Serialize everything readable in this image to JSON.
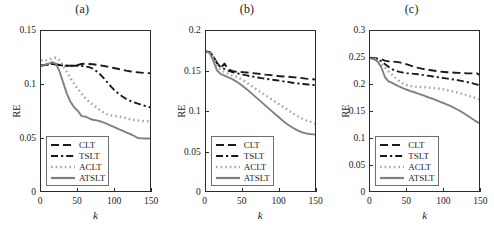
{
  "figure": {
    "width": 494,
    "height": 231,
    "background": "#ffffff",
    "series_styles": {
      "CLT": {
        "color": "#1a1a1a",
        "dash": "8,4",
        "width": 1.9
      },
      "TSLT": {
        "color": "#1a1a1a",
        "dash": "7,3,2.2,3",
        "width": 1.9
      },
      "ACLT": {
        "color": "#a6a6a6",
        "dash": "1.6,3.0",
        "width": 2.4
      },
      "ATSLT": {
        "color": "#808080",
        "dash": "none",
        "width": 1.9
      }
    },
    "legend_labels": [
      "CLT",
      "TSLT",
      "ACLT",
      "ATSLT"
    ]
  },
  "chart_data": [
    {
      "type": "line",
      "title": "(a)",
      "xlabel": "k",
      "ylabel": "RE",
      "xlim": [
        0,
        150
      ],
      "ylim": [
        0,
        0.15
      ],
      "xticks": [
        0,
        50,
        100,
        150
      ],
      "xtick_labels": [
        "0",
        "50",
        "100",
        "150"
      ],
      "yticks": [
        0,
        0.05,
        0.1,
        0.15
      ],
      "ytick_labels": [
        "0",
        "0.05",
        "0.1",
        "0.15"
      ],
      "grid": false,
      "legend_position": "lower left",
      "x": [
        0,
        5,
        10,
        15,
        20,
        25,
        30,
        35,
        40,
        45,
        50,
        55,
        60,
        65,
        70,
        75,
        80,
        85,
        90,
        95,
        100,
        105,
        110,
        115,
        120,
        125,
        130,
        135,
        140,
        145,
        150
      ],
      "series": [
        {
          "name": "CLT",
          "values": [
            0.118,
            0.1185,
            0.119,
            0.1195,
            0.119,
            0.1185,
            0.118,
            0.1178,
            0.1178,
            0.1178,
            0.1185,
            0.1195,
            0.1198,
            0.1195,
            0.1192,
            0.1188,
            0.1182,
            0.1176,
            0.117,
            0.1162,
            0.1155,
            0.1148,
            0.114,
            0.1133,
            0.1127,
            0.1122,
            0.1118,
            0.1115,
            0.1112,
            0.111,
            0.1108
          ]
        },
        {
          "name": "TSLT",
          "values": [
            0.118,
            0.1185,
            0.119,
            0.1195,
            0.119,
            0.1185,
            0.118,
            0.1178,
            0.1178,
            0.1178,
            0.1178,
            0.1176,
            0.1172,
            0.1165,
            0.1152,
            0.1128,
            0.1098,
            0.1062,
            0.1022,
            0.0982,
            0.0948,
            0.0918,
            0.0893,
            0.0872,
            0.0855,
            0.0841,
            0.0829,
            0.0818,
            0.0808,
            0.0798,
            0.0788
          ]
        },
        {
          "name": "ACLT",
          "values": [
            0.1228,
            0.1224,
            0.1232,
            0.1248,
            0.1252,
            0.1228,
            0.1178,
            0.1118,
            0.1062,
            0.1008,
            0.0962,
            0.0918,
            0.0878,
            0.0845,
            0.0818,
            0.0792,
            0.0765,
            0.0742,
            0.0728,
            0.0718,
            0.0712,
            0.0708,
            0.0702,
            0.0694,
            0.0684,
            0.0678,
            0.0672,
            0.0668,
            0.0664,
            0.0662,
            0.0632
          ]
        },
        {
          "name": "ATSLT",
          "values": [
            0.1182,
            0.1186,
            0.1196,
            0.1212,
            0.1198,
            0.1128,
            0.1022,
            0.0918,
            0.0842,
            0.0792,
            0.0758,
            0.0712,
            0.0708,
            0.0692,
            0.0678,
            0.0672,
            0.0664,
            0.0652,
            0.0638,
            0.0622,
            0.0608,
            0.0592,
            0.0578,
            0.0562,
            0.0548,
            0.0532,
            0.0512,
            0.0506,
            0.0504,
            0.0504,
            0.0506
          ]
        }
      ]
    },
    {
      "type": "line",
      "title": "(b)",
      "xlabel": "k",
      "ylabel": "RE",
      "xlim": [
        0,
        150
      ],
      "ylim": [
        0,
        0.2
      ],
      "xticks": [
        0,
        50,
        100,
        150
      ],
      "xtick_labels": [
        "0",
        "50",
        "100",
        "150"
      ],
      "yticks": [
        0,
        0.05,
        0.1,
        0.15,
        0.2
      ],
      "ytick_labels": [
        "0",
        "0.05",
        "0.1",
        "0.15",
        "0.2"
      ],
      "grid": false,
      "legend_position": "lower left",
      "x": [
        0,
        5,
        10,
        15,
        20,
        25,
        30,
        35,
        40,
        45,
        50,
        55,
        60,
        65,
        70,
        75,
        80,
        85,
        90,
        95,
        100,
        105,
        110,
        115,
        120,
        125,
        130,
        135,
        140,
        145,
        150
      ],
      "series": [
        {
          "name": "CLT",
          "values": [
            0.1742,
            0.1738,
            0.1688,
            0.1602,
            0.1548,
            0.1598,
            0.1528,
            0.1508,
            0.1498,
            0.1494,
            0.1492,
            0.1488,
            0.1484,
            0.1478,
            0.1474,
            0.1468,
            0.1462,
            0.1458,
            0.1452,
            0.1446,
            0.1442,
            0.1438,
            0.1436,
            0.1432,
            0.1428,
            0.1424,
            0.1418,
            0.1412,
            0.1408,
            0.1404,
            0.1398
          ]
        },
        {
          "name": "TSLT",
          "values": [
            0.1742,
            0.1738,
            0.1688,
            0.1602,
            0.1548,
            0.1532,
            0.1512,
            0.1494,
            0.1482,
            0.1472,
            0.1462,
            0.1452,
            0.1442,
            0.1434,
            0.1426,
            0.1418,
            0.1412,
            0.1404,
            0.1398,
            0.1392,
            0.1386,
            0.1378,
            0.1372,
            0.1364,
            0.1358,
            0.1352,
            0.1346,
            0.1342,
            0.1338,
            0.1334,
            0.1328
          ]
        },
        {
          "name": "ACLT",
          "values": [
            0.1758,
            0.1742,
            0.1672,
            0.1578,
            0.1512,
            0.1492,
            0.1472,
            0.1452,
            0.1438,
            0.1418,
            0.1392,
            0.1362,
            0.1332,
            0.1302,
            0.1268,
            0.1238,
            0.1208,
            0.1178,
            0.1148,
            0.1118,
            0.1088,
            0.1058,
            0.1028,
            0.0998,
            0.0968,
            0.0942,
            0.0918,
            0.0898,
            0.0882,
            0.0868,
            0.0848
          ]
        },
        {
          "name": "ATSLT",
          "values": [
            0.1752,
            0.1728,
            0.1628,
            0.1512,
            0.1468,
            0.1448,
            0.1428,
            0.1408,
            0.1382,
            0.1352,
            0.1318,
            0.1282,
            0.1242,
            0.1202,
            0.1162,
            0.1122,
            0.1082,
            0.1042,
            0.1002,
            0.0962,
            0.0922,
            0.0882,
            0.0848,
            0.0818,
            0.0792,
            0.0768,
            0.0748,
            0.0736,
            0.0728,
            0.0724,
            0.0722
          ]
        }
      ]
    },
    {
      "type": "line",
      "title": "(c)",
      "xlabel": "k",
      "ylabel": "RE",
      "xlim": [
        0,
        150
      ],
      "ylim": [
        0,
        0.3
      ],
      "xticks": [
        0,
        50,
        100,
        150
      ],
      "xtick_labels": [
        "0",
        "50",
        "100",
        "150"
      ],
      "yticks": [
        0,
        0.05,
        0.1,
        0.15,
        0.2,
        0.25,
        0.3
      ],
      "ytick_labels": [
        "0",
        "0.05",
        "0.1",
        "0.15",
        "0.2",
        "0.25",
        "0.3"
      ],
      "grid": false,
      "legend_position": "lower left",
      "x": [
        0,
        5,
        10,
        15,
        20,
        25,
        30,
        35,
        40,
        45,
        50,
        55,
        60,
        65,
        70,
        75,
        80,
        85,
        90,
        95,
        100,
        105,
        110,
        115,
        120,
        125,
        130,
        135,
        140,
        145,
        150
      ],
      "series": [
        {
          "name": "CLT",
          "values": [
            0.2498,
            0.2496,
            0.2492,
            0.2478,
            0.2452,
            0.2438,
            0.2432,
            0.2428,
            0.2418,
            0.2402,
            0.2382,
            0.2358,
            0.2338,
            0.2318,
            0.2302,
            0.2288,
            0.2278,
            0.2268,
            0.2258,
            0.2248,
            0.2242,
            0.2236,
            0.2232,
            0.2228,
            0.2224,
            0.2222,
            0.2218,
            0.2216,
            0.2214,
            0.2212,
            0.2172
          ]
        },
        {
          "name": "TSLT",
          "values": [
            0.2498,
            0.2492,
            0.2478,
            0.2442,
            0.2388,
            0.2338,
            0.2292,
            0.2262,
            0.2242,
            0.2228,
            0.2218,
            0.2212,
            0.2206,
            0.2198,
            0.2188,
            0.2178,
            0.2168,
            0.2158,
            0.2148,
            0.2138,
            0.2128,
            0.2118,
            0.2108,
            0.2098,
            0.2086,
            0.2072,
            0.2058,
            0.2042,
            0.2026,
            0.2008,
            0.1988
          ]
        },
        {
          "name": "ACLT",
          "values": [
            0.2502,
            0.2492,
            0.2462,
            0.2398,
            0.2322,
            0.2252,
            0.2188,
            0.2128,
            0.2068,
            0.2022,
            0.1998,
            0.1982,
            0.1972,
            0.1966,
            0.1962,
            0.1958,
            0.1952,
            0.1946,
            0.1938,
            0.1928,
            0.1918,
            0.1902,
            0.1888,
            0.1872,
            0.1852,
            0.1832,
            0.1812,
            0.1792,
            0.1772,
            0.1752,
            0.1712
          ]
        },
        {
          "name": "ATSLT",
          "values": [
            0.2498,
            0.2486,
            0.2438,
            0.2338,
            0.2152,
            0.2068,
            0.2038,
            0.2002,
            0.1968,
            0.1938,
            0.1912,
            0.1888,
            0.1866,
            0.1842,
            0.1818,
            0.1792,
            0.1768,
            0.1742,
            0.1716,
            0.1688,
            0.1662,
            0.1632,
            0.1602,
            0.1568,
            0.1532,
            0.1492,
            0.1448,
            0.1402,
            0.1356,
            0.1312,
            0.1282
          ]
        }
      ]
    }
  ]
}
